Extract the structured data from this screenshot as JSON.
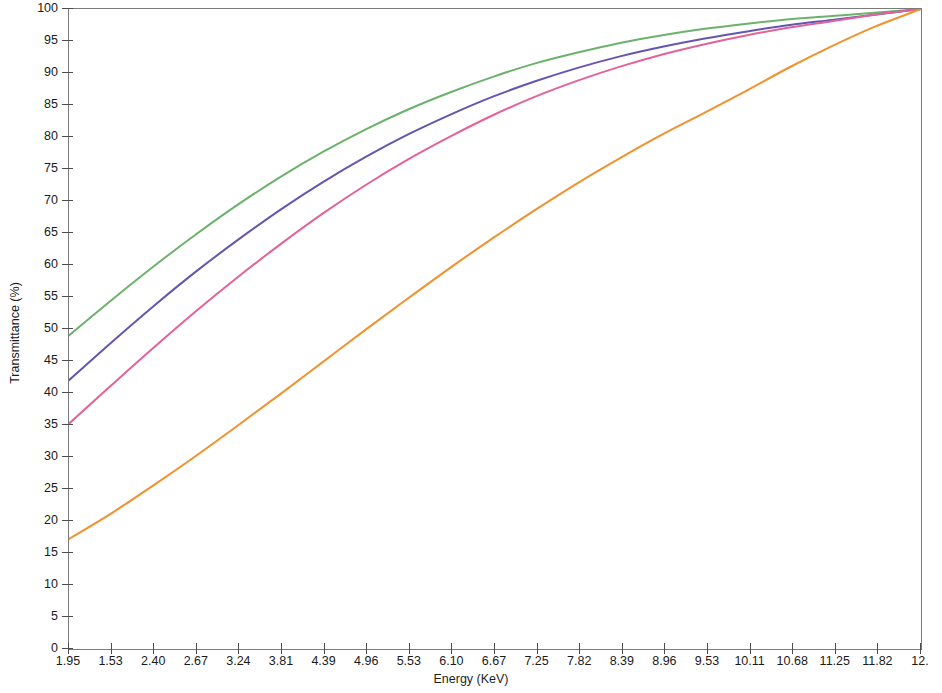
{
  "chart_data": {
    "type": "line",
    "title": "",
    "subtitle": "",
    "xlabel": "Energy (KeV)",
    "ylabel": "Transmittance (%)",
    "xlim": [
      1.95,
      12.0
    ],
    "ylim": [
      0,
      100
    ],
    "grid": false,
    "legend_position": "none",
    "annotations": [],
    "x_tick_labels": [
      "1.95",
      "1.53",
      "2.40",
      "2.67",
      "3.24",
      "3.81",
      "4.39",
      "4.96",
      "5.53",
      "6.10",
      "6.67",
      "7.25",
      "7.82",
      "8.39",
      "8.96",
      "9.53",
      "10.11",
      "10.68",
      "11.25",
      "11.82",
      "12."
    ],
    "y_tick_labels": [
      "100",
      "95",
      "90",
      "85",
      "80",
      "75",
      "70",
      "65",
      "60",
      "55",
      "50",
      "45",
      "40",
      "35",
      "30",
      "25",
      "20",
      "15",
      "10",
      "5",
      "0"
    ],
    "y_ticks": [
      100,
      95,
      90,
      85,
      80,
      75,
      70,
      65,
      60,
      55,
      50,
      45,
      40,
      35,
      30,
      25,
      20,
      15,
      10,
      5,
      0
    ],
    "x": [
      1.95,
      2.45,
      2.95,
      3.45,
      3.95,
      4.45,
      4.95,
      5.45,
      5.95,
      6.45,
      6.95,
      7.45,
      7.95,
      8.45,
      8.95,
      9.45,
      9.95,
      10.45,
      10.95,
      11.45,
      12.0
    ],
    "series": [
      {
        "name": "curve-green",
        "color": "#6cb26c",
        "values": [
          49.0,
          54.5,
          59.8,
          64.8,
          69.5,
          73.8,
          77.7,
          81.2,
          84.3,
          87.0,
          89.4,
          91.5,
          93.2,
          94.7,
          95.9,
          96.9,
          97.7,
          98.4,
          98.9,
          99.4,
          100.0
        ]
      },
      {
        "name": "curve-purple",
        "color": "#6655b0",
        "values": [
          42.0,
          47.9,
          53.6,
          59.0,
          64.0,
          68.7,
          73.0,
          76.9,
          80.4,
          83.5,
          86.3,
          88.7,
          90.8,
          92.6,
          94.1,
          95.4,
          96.5,
          97.5,
          98.3,
          99.1,
          100.0
        ]
      },
      {
        "name": "curve-pink",
        "color": "#e2639a",
        "values": [
          35.2,
          41.2,
          47.1,
          52.8,
          58.2,
          63.3,
          68.1,
          72.5,
          76.5,
          80.1,
          83.4,
          86.3,
          88.8,
          91.0,
          92.9,
          94.5,
          95.9,
          97.1,
          98.1,
          99.1,
          100.0
        ]
      },
      {
        "name": "curve-orange",
        "color": "#f0922e",
        "values": [
          17.2,
          21.2,
          25.6,
          30.2,
          35.0,
          39.9,
          44.9,
          49.9,
          54.8,
          59.6,
          64.2,
          68.6,
          72.8,
          76.7,
          80.4,
          83.8,
          87.3,
          90.9,
          94.2,
          97.2,
          100.0
        ]
      }
    ]
  }
}
